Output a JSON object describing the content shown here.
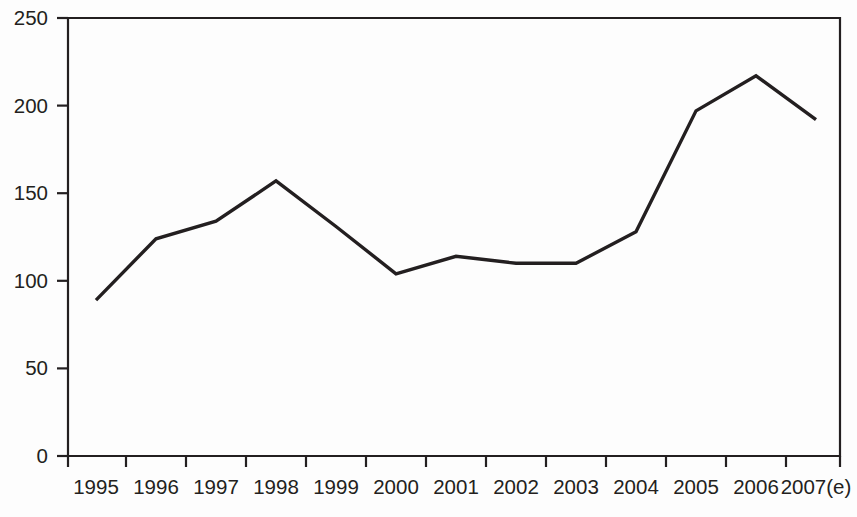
{
  "chart_data": {
    "type": "line",
    "title": "",
    "subtitle": "",
    "xlabel": "",
    "ylabel": "",
    "categories": [
      "1995",
      "1996",
      "1997",
      "1998",
      "1999",
      "2000",
      "2001",
      "2002",
      "2003",
      "2004",
      "2005",
      "2006",
      "2007(e)"
    ],
    "values": [
      89,
      124,
      134,
      157,
      131,
      104,
      114,
      110,
      110,
      128,
      197,
      217,
      192
    ],
    "series": [
      {
        "name": "series-1",
        "values": [
          89,
          124,
          134,
          157,
          131,
          104,
          114,
          110,
          110,
          128,
          197,
          217,
          192
        ],
        "color": "#231f20"
      }
    ],
    "ylim": [
      0,
      250
    ],
    "yticks": [
      0,
      50,
      100,
      150,
      200,
      250
    ],
    "ytick_labels": [
      "0",
      "50",
      "100",
      "150",
      "200",
      "250"
    ],
    "xtick_labels": [
      "1995",
      "1996",
      "1997",
      "1998",
      "1999",
      "2000",
      "2001",
      "2002",
      "2003",
      "2004",
      "2005",
      "2006",
      "2007(e)"
    ],
    "grid": false,
    "legend": false,
    "legend_position": "none",
    "annotations": []
  },
  "style": {
    "line_color": "#231f20",
    "axis_color": "#231f20",
    "background": "#fdfdfd",
    "text_color": "#231f20"
  },
  "geometry": {
    "plot_left": 68,
    "plot_right": 840,
    "plot_top": 18,
    "plot_bottom": 456,
    "point_x_start": 96,
    "point_x_step": 60,
    "y_value_top": 250,
    "y_value_bottom": 0
  }
}
